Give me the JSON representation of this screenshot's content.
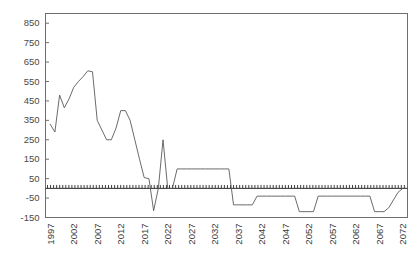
{
  "chart_data": {
    "type": "line",
    "title": "",
    "subtitle": "",
    "xlabel": "",
    "ylabel": "",
    "xlim": [
      1996,
      2073
    ],
    "ylim": [
      -150,
      900
    ],
    "grid": false,
    "legend": null,
    "y_ticks": [
      850,
      750,
      650,
      550,
      450,
      350,
      250,
      150,
      50,
      -50,
      -150
    ],
    "y_tick_labels": [
      "850",
      "750",
      "650",
      "550",
      "450",
      "350",
      "250",
      "150",
      "50",
      "-50",
      "-150"
    ],
    "x_ticks": [
      1997,
      2002,
      2007,
      2012,
      2017,
      2022,
      2027,
      2032,
      2037,
      2042,
      2047,
      2052,
      2057,
      2062,
      2067,
      2072
    ],
    "x_tick_labels": [
      "1997",
      "2002",
      "2007",
      "2012",
      "2017",
      "2022",
      "2027",
      "2032",
      "2037",
      "2042",
      "2047",
      "2052",
      "2057",
      "2062",
      "2067",
      "2072"
    ],
    "annotations": [
      {
        "name": "zero-reference-line",
        "value": 0,
        "style": "hatched-comb"
      }
    ],
    "series": [
      {
        "name": "series-1",
        "color": "#5a5a5a",
        "x": [
          1997,
          1998,
          1999,
          2000,
          2001,
          2002,
          2003,
          2004,
          2005,
          2006,
          2007,
          2008,
          2009,
          2010,
          2011,
          2012,
          2013,
          2014,
          2015,
          2016,
          2017,
          2018,
          2019,
          2020,
          2021,
          2022,
          2023,
          2024,
          2025,
          2026,
          2027,
          2028,
          2029,
          2030,
          2031,
          2032,
          2033,
          2034,
          2035,
          2036,
          2037,
          2038,
          2039,
          2040,
          2041,
          2042,
          2043,
          2044,
          2045,
          2046,
          2047,
          2048,
          2049,
          2050,
          2051,
          2052,
          2053,
          2054,
          2055,
          2056,
          2057,
          2058,
          2059,
          2060,
          2061,
          2062,
          2063,
          2064,
          2065,
          2066,
          2067,
          2068,
          2069,
          2070,
          2071,
          2072
        ],
        "y": [
          330,
          290,
          480,
          415,
          460,
          520,
          550,
          575,
          605,
          600,
          350,
          300,
          250,
          250,
          310,
          400,
          400,
          350,
          250,
          150,
          55,
          50,
          -115,
          0,
          250,
          0,
          0,
          100,
          100,
          100,
          100,
          100,
          100,
          100,
          100,
          100,
          100,
          100,
          100,
          -85,
          -85,
          -85,
          -85,
          -85,
          -40,
          -40,
          -40,
          -40,
          -40,
          -40,
          -40,
          -40,
          -40,
          -120,
          -120,
          -120,
          -120,
          -40,
          -40,
          -40,
          -40,
          -40,
          -40,
          -40,
          -40,
          -40,
          -40,
          -40,
          -40,
          -120,
          -120,
          -120,
          -100,
          -60,
          -20,
          0
        ]
      }
    ]
  }
}
